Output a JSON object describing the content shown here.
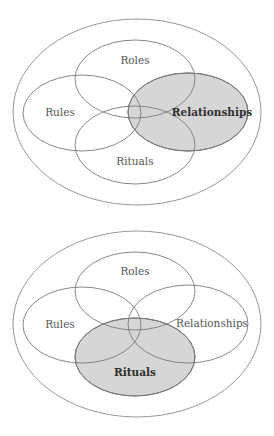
{
  "diagrams": [
    {
      "name": "relationships-highlighted",
      "offset_y": 0,
      "highlighted": "Relationships",
      "outer": {
        "cx": 137,
        "cy": 112,
        "rx": 124,
        "ry": 93
      },
      "sets": [
        {
          "label": "Roles",
          "cx": 135,
          "cy": 79,
          "rx": 60,
          "ry": 39,
          "label_x": 135,
          "label_y": 61
        },
        {
          "label": "Rules",
          "cx": 82,
          "cy": 113,
          "rx": 59,
          "ry": 38,
          "label_x": 60,
          "label_y": 113
        },
        {
          "label": "Relationships",
          "cx": 188,
          "cy": 112,
          "rx": 60,
          "ry": 39,
          "label_x": 212,
          "label_y": 113
        },
        {
          "label": "Rituals",
          "cx": 135,
          "cy": 145,
          "rx": 60,
          "ry": 39,
          "label_x": 135,
          "label_y": 162
        }
      ]
    },
    {
      "name": "rituals-highlighted",
      "offset_y": 212,
      "highlighted": "Rituals",
      "outer": {
        "cx": 137,
        "cy": 324,
        "rx": 124,
        "ry": 93
      },
      "sets": [
        {
          "label": "Roles",
          "cx": 135,
          "cy": 291,
          "rx": 60,
          "ry": 39,
          "label_x": 135,
          "label_y": 272
        },
        {
          "label": "Rules",
          "cx": 82,
          "cy": 325,
          "rx": 59,
          "ry": 38,
          "label_x": 60,
          "label_y": 325
        },
        {
          "label": "Relationships",
          "cx": 188,
          "cy": 324,
          "rx": 60,
          "ry": 39,
          "label_x": 212,
          "label_y": 324
        },
        {
          "label": "Rituals",
          "cx": 135,
          "cy": 357,
          "rx": 60,
          "ry": 39,
          "label_x": 135,
          "label_y": 373
        }
      ]
    }
  ],
  "colors": {
    "highlight_fill": "#d6d6d6",
    "stroke": "#7a7a7a",
    "label": "#555555",
    "label_highlight": "#2e2e2e"
  }
}
